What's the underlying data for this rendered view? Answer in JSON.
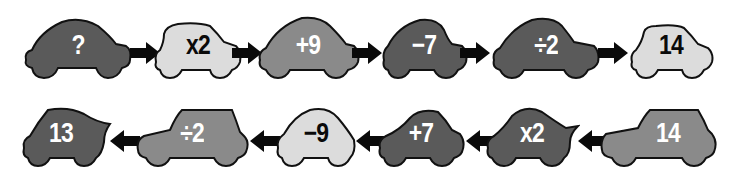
{
  "colors": {
    "dark": "#5a5a5a",
    "mid": "#8a8a8a",
    "light": "#dcdcdc",
    "outline": "#111111",
    "arrow": "#0a0a0a",
    "text_on_dark": "#ffffff",
    "text_on_light": "#0a0a0a"
  },
  "top_row": {
    "direction": "right",
    "cars": [
      {
        "label": "?",
        "shade": "dark"
      },
      {
        "label": "x2",
        "shade": "light"
      },
      {
        "label": "+9",
        "shade": "mid"
      },
      {
        "label": "−7",
        "shade": "dark"
      },
      {
        "label": "÷2",
        "shade": "dark"
      },
      {
        "label": "14",
        "shade": "light"
      }
    ]
  },
  "bottom_row": {
    "direction": "left",
    "cars": [
      {
        "label": "13",
        "shade": "dark"
      },
      {
        "label": "÷2",
        "shade": "mid"
      },
      {
        "label": "−9",
        "shade": "light"
      },
      {
        "label": "+7",
        "shade": "dark"
      },
      {
        "label": "x2",
        "shade": "dark"
      },
      {
        "label": "14",
        "shade": "mid"
      }
    ]
  },
  "icons": {
    "car": "car-icon",
    "arrow_right": "arrow-right-icon",
    "arrow_left": "arrow-left-icon"
  }
}
